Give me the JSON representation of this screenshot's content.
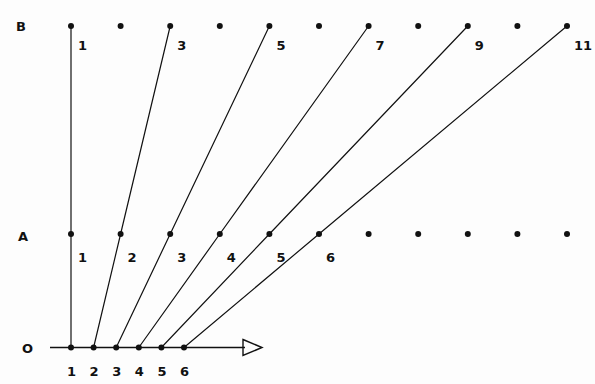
{
  "figure": {
    "title": "",
    "background_color": "#fdfdfd",
    "ink_color": "#111111",
    "width": 595,
    "height": 384
  },
  "rows": {
    "O": {
      "label": "O",
      "label_x": 22,
      "label_y": 341,
      "y": 347.5,
      "axis": {
        "name": "horizontal-axis",
        "x_start": 50,
        "x_end": 262,
        "arrowhead": true,
        "arrow_tip_x": 262,
        "arrow_back_x": 243,
        "arrow_half_height": 8
      },
      "spacing": 22.6,
      "points": [
        {
          "label": "1",
          "x": 71.0
        },
        {
          "label": "2",
          "x": 93.6
        },
        {
          "label": "3",
          "x": 116.2
        },
        {
          "label": "4",
          "x": 138.8
        },
        {
          "label": "5",
          "x": 161.4
        },
        {
          "label": "6",
          "x": 184.0
        }
      ],
      "label_dy": 16
    },
    "A": {
      "label": "A",
      "label_x": 18,
      "label_y": 229,
      "y": 234.0,
      "spacing": 49.6,
      "points": [
        {
          "label": "1",
          "x": 71.0
        },
        {
          "label": "2",
          "x": 120.6
        },
        {
          "label": "3",
          "x": 170.2
        },
        {
          "label": "4",
          "x": 219.8
        },
        {
          "label": "5",
          "x": 269.4
        },
        {
          "label": "6",
          "x": 319.0
        },
        {
          "label": "",
          "x": 368.6
        },
        {
          "label": "",
          "x": 418.2
        },
        {
          "label": "",
          "x": 467.8
        },
        {
          "label": "",
          "x": 517.4
        },
        {
          "label": "",
          "x": 567.0
        }
      ],
      "label_dx": 7,
      "label_dy": 16
    },
    "B": {
      "label": "B",
      "label_x": 16,
      "label_y": 19,
      "y": 26.0,
      "spacing": 49.6,
      "points": [
        {
          "label": "1",
          "x": 71.0
        },
        {
          "label": "",
          "x": 120.6
        },
        {
          "label": "3",
          "x": 170.2
        },
        {
          "label": "",
          "x": 219.8
        },
        {
          "label": "5",
          "x": 269.4
        },
        {
          "label": "",
          "x": 319.0
        },
        {
          "label": "7",
          "x": 368.6
        },
        {
          "label": "",
          "x": 418.2
        },
        {
          "label": "9",
          "x": 467.8
        },
        {
          "label": "",
          "x": 517.4
        },
        {
          "label": "11",
          "x": 567.0
        }
      ],
      "label_dx": 7,
      "label_dy": 12
    }
  },
  "rays": [
    {
      "name": "ray-1",
      "o_label": "1",
      "a_label": "1",
      "b_label": "1",
      "x0": 71.0,
      "x1": 71.0,
      "x2": 71.0
    },
    {
      "name": "ray-2",
      "o_label": "2",
      "a_label": "2",
      "b_label": "3",
      "x0": 93.6,
      "x1": 120.6,
      "x2": 170.2
    },
    {
      "name": "ray-3",
      "o_label": "3",
      "a_label": "3",
      "b_label": "5",
      "x0": 116.2,
      "x1": 170.2,
      "x2": 269.4
    },
    {
      "name": "ray-4",
      "o_label": "4",
      "a_label": "4",
      "b_label": "7",
      "x0": 138.8,
      "x1": 219.8,
      "x2": 368.6
    },
    {
      "name": "ray-5",
      "o_label": "5",
      "a_label": "5",
      "b_label": "9",
      "x0": 161.4,
      "x1": 269.4,
      "x2": 467.8
    },
    {
      "name": "ray-6",
      "o_label": "6",
      "a_label": "6",
      "b_label": "11",
      "x0": 184.0,
      "x1": 319.0,
      "x2": 567.0
    }
  ],
  "style": {
    "dot_radius_small": 2.6,
    "dot_radius_large": 3.0,
    "line_width": 1.2,
    "axis_width": 1.4
  }
}
